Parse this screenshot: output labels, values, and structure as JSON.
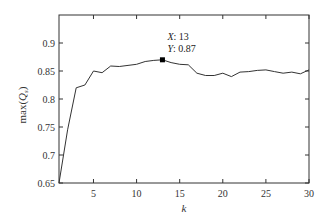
{
  "chart_data": {
    "type": "line",
    "title": "",
    "xlabel": "k",
    "ylabel": "max(Q_s)",
    "ylabel_main": "max(",
    "ylabel_sym": "Q",
    "ylabel_sub": "s",
    "ylabel_close": ")",
    "xlim": [
      1,
      30
    ],
    "ylim": [
      0.65,
      0.95
    ],
    "grid": false,
    "x_ticks": [
      5,
      10,
      15,
      20,
      25,
      30
    ],
    "y_ticks": [
      0.65,
      0.7,
      0.75,
      0.8,
      0.85,
      0.9
    ],
    "x_tick_labels": [
      "5",
      "10",
      "15",
      "20",
      "25",
      "30"
    ],
    "y_tick_labels": [
      "0.65",
      "0.7",
      "0.75",
      "0.8",
      "0.85",
      "0.9"
    ],
    "series": [
      {
        "name": "max(Q_s)",
        "x": [
          1,
          2,
          3,
          4,
          5,
          6,
          7,
          8,
          9,
          10,
          11,
          12,
          13,
          14,
          15,
          16,
          17,
          18,
          19,
          20,
          21,
          22,
          23,
          24,
          25,
          26,
          27,
          28,
          29,
          30
        ],
        "values": [
          0.65,
          0.745,
          0.82,
          0.825,
          0.85,
          0.847,
          0.859,
          0.858,
          0.86,
          0.862,
          0.867,
          0.869,
          0.87,
          0.865,
          0.862,
          0.861,
          0.846,
          0.842,
          0.842,
          0.846,
          0.84,
          0.848,
          0.849,
          0.851,
          0.852,
          0.849,
          0.846,
          0.848,
          0.845,
          0.852
        ],
        "color": "#333333"
      }
    ],
    "annotations": [
      {
        "type": "datatip",
        "x": 13,
        "y": 0.87,
        "x_label": "X",
        "x_value": "13",
        "y_label": "Y",
        "y_value": "0.87"
      }
    ]
  }
}
